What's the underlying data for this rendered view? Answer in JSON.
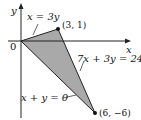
{
  "diagram": {
    "type": "region-plot",
    "axes": {
      "x_label": "x",
      "y_label": "y",
      "origin_label": "0"
    },
    "region": {
      "shape": "triangle",
      "fill": "#a9a9a9",
      "vertices": [
        {
          "x": 0,
          "y": 0
        },
        {
          "x": 3,
          "y": 1
        },
        {
          "x": 6,
          "y": -6
        }
      ]
    },
    "points": [
      {
        "label": "(3, 1)",
        "x": 3,
        "y": 1
      },
      {
        "label": "(6, −6)",
        "x": 6,
        "y": -6
      }
    ],
    "lines": [
      {
        "label": "x = 3y"
      },
      {
        "label": "7x + 3y = 24"
      },
      {
        "label": "x + y = 0"
      }
    ]
  }
}
